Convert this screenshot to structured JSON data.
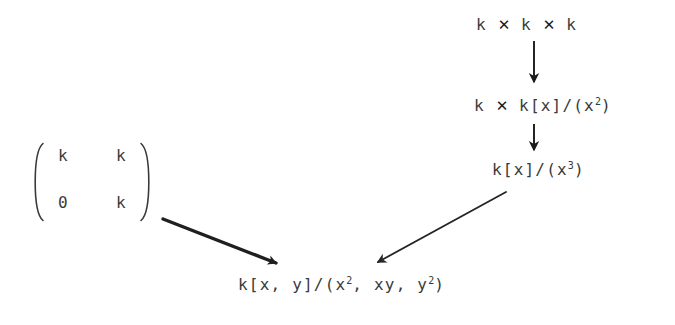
{
  "diagram": {
    "type": "commutative-diagram",
    "background": "#ffffff",
    "ink_color": "#3a3a3a",
    "nodes": {
      "k_times_k_times_k": {
        "parts": [
          "k",
          "✕",
          "k",
          "✕",
          "k"
        ],
        "plain": "k × k × k"
      },
      "k_times_kx_mod_x2": {
        "lead": "k",
        "op": "✕",
        "ring": "k[x]/(x",
        "exp": "2",
        "close": ")",
        "plain": "k × k[x]/(x^2)"
      },
      "kx_mod_x3": {
        "ring": "k[x]/(x",
        "exp": "3",
        "close": ")",
        "plain": "k[x]/(x^3)"
      },
      "kxy_mod_ideal": {
        "ring": "k[x, y]/(x",
        "exp1": "2",
        "mid": ", xy, y",
        "exp2": "2",
        "close": ")",
        "plain": "k[x, y]/(x^2, xy, y^2)"
      },
      "upper_triangular_matrix": {
        "entries": [
          [
            "k",
            "k"
          ],
          [
            "0",
            "k"
          ]
        ],
        "plain": "[[k, k], [0, k]]"
      }
    },
    "arrows": [
      {
        "name": "arrow-kkk-to-kx2",
        "kind": "vertical-down"
      },
      {
        "name": "arrow-kx2-to-kx3",
        "kind": "vertical-down"
      },
      {
        "name": "arrow-matrix-to-kxy",
        "kind": "diagonal-down-right"
      },
      {
        "name": "arrow-kx3-to-kxy",
        "kind": "diagonal-down-left"
      }
    ]
  }
}
